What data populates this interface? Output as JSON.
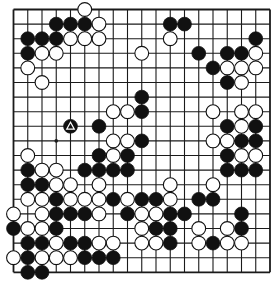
{
  "diagram": {
    "type": "go-board",
    "size": 19,
    "colors": {
      "background": "#ffffff",
      "line": "#1a1a1a",
      "black": "#111111",
      "white": "#ffffff"
    },
    "star_points_visible": [
      [
        3,
        9
      ]
    ],
    "marked_stones": [
      {
        "col": 4,
        "row": 8,
        "color": "black",
        "mark": "triangle"
      }
    ],
    "stones": {
      "black": [
        [
          3,
          1
        ],
        [
          4,
          1
        ],
        [
          5,
          1
        ],
        [
          11,
          1
        ],
        [
          12,
          1
        ],
        [
          1,
          2
        ],
        [
          2,
          2
        ],
        [
          3,
          2
        ],
        [
          17,
          2
        ],
        [
          1,
          3
        ],
        [
          13,
          3
        ],
        [
          15,
          3
        ],
        [
          16,
          3
        ],
        [
          14,
          4
        ],
        [
          15,
          5
        ],
        [
          9,
          6
        ],
        [
          9,
          7
        ],
        [
          4,
          8
        ],
        [
          6,
          8
        ],
        [
          15,
          8
        ],
        [
          17,
          8
        ],
        [
          9,
          9
        ],
        [
          16,
          9
        ],
        [
          17,
          9
        ],
        [
          6,
          10
        ],
        [
          8,
          10
        ],
        [
          15,
          10
        ],
        [
          1,
          11
        ],
        [
          5,
          11
        ],
        [
          6,
          11
        ],
        [
          7,
          11
        ],
        [
          8,
          11
        ],
        [
          15,
          11
        ],
        [
          16,
          11
        ],
        [
          17,
          11
        ],
        [
          1,
          12
        ],
        [
          2,
          12
        ],
        [
          3,
          13
        ],
        [
          7,
          13
        ],
        [
          9,
          13
        ],
        [
          10,
          13
        ],
        [
          13,
          13
        ],
        [
          14,
          13
        ],
        [
          3,
          14
        ],
        [
          4,
          14
        ],
        [
          5,
          14
        ],
        [
          8,
          14
        ],
        [
          11,
          14
        ],
        [
          12,
          14
        ],
        [
          16,
          14
        ],
        [
          0,
          15
        ],
        [
          3,
          15
        ],
        [
          10,
          15
        ],
        [
          11,
          15
        ],
        [
          16,
          15
        ],
        [
          1,
          16
        ],
        [
          2,
          16
        ],
        [
          4,
          16
        ],
        [
          5,
          16
        ],
        [
          11,
          16
        ],
        [
          14,
          16
        ],
        [
          1,
          17
        ],
        [
          5,
          17
        ],
        [
          6,
          17
        ],
        [
          7,
          17
        ],
        [
          1,
          18
        ],
        [
          2,
          18
        ]
      ],
      "white": [
        [
          5,
          0
        ],
        [
          6,
          1
        ],
        [
          4,
          2
        ],
        [
          5,
          2
        ],
        [
          6,
          2
        ],
        [
          11,
          2
        ],
        [
          2,
          3
        ],
        [
          3,
          3
        ],
        [
          9,
          3
        ],
        [
          17,
          3
        ],
        [
          1,
          4
        ],
        [
          15,
          4
        ],
        [
          16,
          4
        ],
        [
          17,
          4
        ],
        [
          2,
          5
        ],
        [
          16,
          5
        ],
        [
          7,
          7
        ],
        [
          8,
          7
        ],
        [
          14,
          7
        ],
        [
          16,
          7
        ],
        [
          17,
          7
        ],
        [
          16,
          8
        ],
        [
          7,
          9
        ],
        [
          8,
          9
        ],
        [
          14,
          9
        ],
        [
          15,
          9
        ],
        [
          1,
          10
        ],
        [
          7,
          10
        ],
        [
          16,
          10
        ],
        [
          17,
          10
        ],
        [
          2,
          11
        ],
        [
          3,
          11
        ],
        [
          3,
          12
        ],
        [
          4,
          12
        ],
        [
          6,
          12
        ],
        [
          11,
          12
        ],
        [
          14,
          12
        ],
        [
          1,
          13
        ],
        [
          2,
          13
        ],
        [
          4,
          13
        ],
        [
          5,
          13
        ],
        [
          6,
          13
        ],
        [
          8,
          13
        ],
        [
          11,
          13
        ],
        [
          0,
          14
        ],
        [
          2,
          14
        ],
        [
          6,
          14
        ],
        [
          9,
          14
        ],
        [
          10,
          14
        ],
        [
          1,
          15
        ],
        [
          2,
          15
        ],
        [
          9,
          15
        ],
        [
          13,
          15
        ],
        [
          15,
          15
        ],
        [
          3,
          16
        ],
        [
          6,
          16
        ],
        [
          7,
          16
        ],
        [
          9,
          16
        ],
        [
          10,
          16
        ],
        [
          13,
          16
        ],
        [
          15,
          16
        ],
        [
          16,
          16
        ],
        [
          0,
          17
        ],
        [
          2,
          17
        ],
        [
          3,
          17
        ],
        [
          4,
          17
        ]
      ]
    }
  }
}
